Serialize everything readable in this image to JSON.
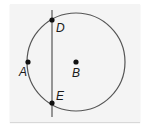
{
  "diagram": {
    "type": "geometry-circle-with-line",
    "colors": {
      "background": "#ffffff",
      "panel": "#f4f4f4",
      "stroke": "#555555",
      "point": "#111111",
      "label": "#1a1a1a"
    },
    "circle": {
      "cx": 76,
      "cy": 62,
      "r": 49,
      "center_label": "B"
    },
    "line": {
      "x1": 52,
      "y1": 10,
      "x2": 52,
      "y2": 117
    },
    "points": [
      {
        "label": "D",
        "x": 52,
        "y": 20,
        "lx": 56,
        "ly": 32
      },
      {
        "label": "A",
        "x": 28,
        "y": 62,
        "lx": 19,
        "ly": 76
      },
      {
        "label": "B",
        "x": 76,
        "y": 62,
        "lx": 72,
        "ly": 77
      },
      {
        "label": "E",
        "x": 52,
        "y": 103,
        "lx": 56,
        "ly": 100
      }
    ]
  }
}
